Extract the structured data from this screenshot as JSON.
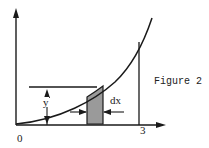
{
  "figure": {
    "caption": "Figure 2",
    "labels": {
      "origin": "0",
      "x_end": "3",
      "height": "y",
      "width": "dx"
    },
    "colors": {
      "line": "#1a1a1a",
      "strip_fill": "#9a9a9a",
      "background": "#ffffff"
    }
  }
}
